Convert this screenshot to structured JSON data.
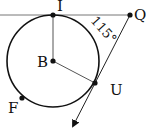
{
  "diagram": {
    "type": "geometry",
    "points": {
      "I": {
        "label": "I",
        "x": 53,
        "y": 15
      },
      "Q": {
        "label": "Q",
        "x": 130,
        "y": 15
      },
      "B": {
        "label": "B",
        "x": 53,
        "y": 61
      },
      "U": {
        "label": "U",
        "x": 95,
        "y": 83
      },
      "F": {
        "label": "F",
        "x": 22,
        "y": 98
      }
    },
    "circle": {
      "center": "B",
      "radius": 46
    },
    "angle_label": "115°",
    "colors": {
      "stroke": "#111111",
      "tangent_line": "#777777",
      "background": "#ffffff"
    }
  }
}
